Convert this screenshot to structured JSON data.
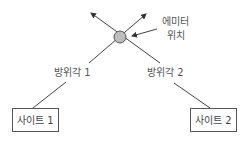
{
  "emitter": {
    "label_line1": "에미터",
    "label_line2": "위치",
    "fill": "#bdbdbd"
  },
  "bearings": [
    {
      "label": "방위각 1"
    },
    {
      "label": "방위각 2"
    }
  ],
  "sites": [
    {
      "label": "사이트 1"
    },
    {
      "label": "사이트 2"
    }
  ],
  "colors": {
    "line": "#444444",
    "box_border": "#555555"
  }
}
